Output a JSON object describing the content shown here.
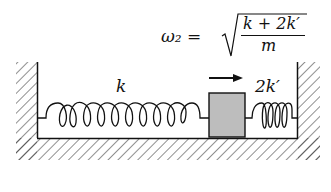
{
  "diagram": {
    "formula": {
      "lhs": "ω₂ =",
      "numerator": "k + 2k′",
      "denominator": "m",
      "text": "ω₂ = √((k + 2k′)/m)"
    },
    "labels": {
      "left_spring": "k",
      "right_spring": "2k′"
    },
    "elements": [
      "left wall (hatched)",
      "floor (hatched)",
      "right wall (hatched)",
      "spring k",
      "block (mass m)",
      "spring 2k′",
      "arrow pointing right"
    ],
    "colors": {
      "block_fill": "#bdbdbd",
      "line": "#111111"
    }
  }
}
